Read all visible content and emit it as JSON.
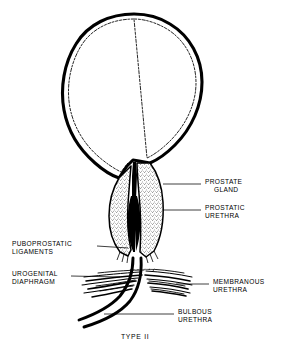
{
  "figure": {
    "caption": "TYPE II",
    "background_color": "#ffffff",
    "ink_color": "#000000"
  },
  "labels": [
    {
      "id": "prostate-gland",
      "line1": "PROSTATE",
      "line2": "GLAND",
      "side": "right"
    },
    {
      "id": "prostatic-urethra",
      "line1": "PROSTATIC",
      "line2": "URETHRA",
      "side": "right"
    },
    {
      "id": "puboprostatic-ligaments",
      "line1": "PUBOPROSTATIC",
      "line2": "LIGAMENTS",
      "side": "left"
    },
    {
      "id": "urogenital-diaphragm",
      "line1": "UROGENITAL",
      "line2": "DIAPHRAGM",
      "side": "left"
    },
    {
      "id": "membranous-urethra",
      "line1": "MEMBRANOUS",
      "line2": "URETHRA",
      "side": "right"
    },
    {
      "id": "bulbous-urethra",
      "line1": "BULBOUS",
      "line2": "URETHRA",
      "side": "right"
    }
  ],
  "structures": {
    "bladder": "bladder",
    "prostate": "prostate",
    "urethral_lumen": "urethral lumen",
    "urogenital_diaphragm": "urogenital diaphragm",
    "urethra_distal": "distal urethra"
  }
}
